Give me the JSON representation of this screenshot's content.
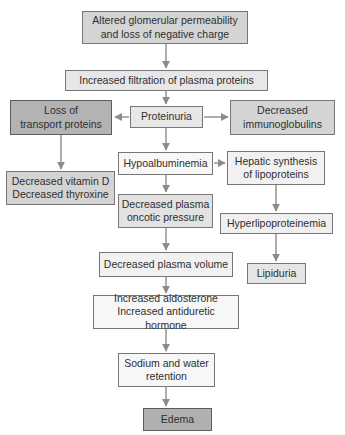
{
  "flowchart": {
    "type": "flowchart",
    "topic": "Pathophysiology flowchart from altered glomerular permeability to edema",
    "background": "#ffffff",
    "arrow_color": "#8c8c8c",
    "border_color": "#777777",
    "text_color": "#2f2f2f",
    "nodes": {
      "altered": {
        "label": "Altered glomerular permeability\nand loss of negative charge",
        "fill": "#d4d4d4"
      },
      "filtration": {
        "label": "Increased filtration of plasma proteins",
        "fill": "#e7e7e7"
      },
      "proteinuria": {
        "label": "Proteinuria",
        "fill": "#e7e7e7"
      },
      "loss_transport": {
        "label": "Loss of\ntransport proteins",
        "fill": "#b3b3b3"
      },
      "decreased_ig": {
        "label": "Decreased\nimmunoglobulins",
        "fill": "#d4d4d4"
      },
      "vitamin_d": {
        "label": "Decreased vitamin D\nDecreased thyroxine",
        "fill": "#d4d4d4"
      },
      "hypoalbuminemia": {
        "label": "Hypoalbuminemia",
        "fill": "#f7f7f7"
      },
      "hepatic": {
        "label": "Hepatic synthesis\nof lipoproteins",
        "fill": "#f1f1f1"
      },
      "oncotic": {
        "label": "Decreased plasma\noncotic pressure",
        "fill": "#e2e2e2"
      },
      "hyperlipo": {
        "label": "Hyperlipoproteinemia",
        "fill": "#f0f0f0"
      },
      "plasma_volume": {
        "label": "Decreased plasma volume",
        "fill": "#f1f1f1"
      },
      "lipiduria": {
        "label": "Lipiduria",
        "fill": "#e5e5e5"
      },
      "aldosterone": {
        "label": "Increased aldosterone\nIncreased antiduretic hormone",
        "fill": "#f7f7f7"
      },
      "sodium_water": {
        "label": "Sodium and water\nretention",
        "fill": "#f7f7f7"
      },
      "edema": {
        "label": "Edema",
        "fill": "#b0b0b0"
      }
    },
    "edges": [
      {
        "from": "altered",
        "to": "filtration"
      },
      {
        "from": "filtration",
        "to": "proteinuria"
      },
      {
        "from": "proteinuria",
        "to": "loss_transport"
      },
      {
        "from": "proteinuria",
        "to": "decreased_ig"
      },
      {
        "from": "proteinuria",
        "to": "hypoalbuminemia"
      },
      {
        "from": "loss_transport",
        "to": "vitamin_d"
      },
      {
        "from": "hypoalbuminemia",
        "to": "hepatic"
      },
      {
        "from": "hypoalbuminemia",
        "to": "oncotic"
      },
      {
        "from": "hepatic",
        "to": "hyperlipo"
      },
      {
        "from": "hyperlipo",
        "to": "lipiduria"
      },
      {
        "from": "oncotic",
        "to": "plasma_volume"
      },
      {
        "from": "plasma_volume",
        "to": "aldosterone"
      },
      {
        "from": "aldosterone",
        "to": "sodium_water"
      },
      {
        "from": "sodium_water",
        "to": "edema"
      }
    ]
  }
}
